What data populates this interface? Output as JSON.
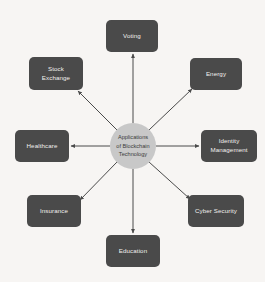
{
  "diagram": {
    "type": "radial-hub-and-spoke",
    "background_color": "#f7f5f3",
    "node_fill_color": "#4a4a4a",
    "node_text_color": "#f2f0ee",
    "hub_fill_color": "#c8c8c8",
    "hub_text_color": "#3b3b3b",
    "edge_color": "#4a4a4a",
    "arrow_direction": "outward-from-hub",
    "hub": {
      "label": "Applications\nof Blockchain\nTechnology",
      "label_flat": "Applications of Blockchain Technology",
      "shape": "circle",
      "cx": 133,
      "cy": 146,
      "r": 23
    },
    "nodes": [
      {
        "id": "voting",
        "label": "Voting",
        "position": "top",
        "x": 106,
        "y": 20,
        "width": 52,
        "height": 32
      },
      {
        "id": "energy",
        "label": "Energy",
        "position": "top-right",
        "x": 190,
        "y": 58,
        "width": 52,
        "height": 32
      },
      {
        "id": "identity-management",
        "label": "Identity\nManagement",
        "label_flat": "Identity Management",
        "position": "right",
        "x": 201,
        "y": 130,
        "width": 56,
        "height": 32
      },
      {
        "id": "cyber-security",
        "label": "Cyber Security",
        "position": "bottom-right",
        "x": 188,
        "y": 195,
        "width": 56,
        "height": 32
      },
      {
        "id": "education",
        "label": "Education",
        "position": "bottom",
        "x": 106,
        "y": 235,
        "width": 54,
        "height": 32
      },
      {
        "id": "insurance",
        "label": "Insurance",
        "position": "bottom-left",
        "x": 27,
        "y": 195,
        "width": 54,
        "height": 32
      },
      {
        "id": "healthcare",
        "label": "Healthcare",
        "position": "left",
        "x": 15,
        "y": 130,
        "width": 54,
        "height": 32
      },
      {
        "id": "stock-exchange",
        "label": "Stock\nExchange",
        "label_flat": "Stock Exchange",
        "position": "top-left",
        "x": 29,
        "y": 57,
        "width": 54,
        "height": 33
      }
    ],
    "edges": [
      {
        "from": "hub",
        "to": "voting",
        "x1": 133,
        "y1": 123,
        "x2": 133,
        "y2": 54
      },
      {
        "from": "hub",
        "to": "energy",
        "x1": 149,
        "y1": 130,
        "x2": 192,
        "y2": 89
      },
      {
        "from": "hub",
        "to": "identity-management",
        "x1": 156,
        "y1": 146,
        "x2": 199,
        "y2": 146
      },
      {
        "from": "hub",
        "to": "cyber-security",
        "x1": 149,
        "y1": 162,
        "x2": 190,
        "y2": 199
      },
      {
        "from": "hub",
        "to": "education",
        "x1": 133,
        "y1": 169,
        "x2": 133,
        "y2": 233
      },
      {
        "from": "hub",
        "to": "insurance",
        "x1": 117,
        "y1": 162,
        "x2": 80,
        "y2": 200
      },
      {
        "from": "hub",
        "to": "healthcare",
        "x1": 110,
        "y1": 146,
        "x2": 71,
        "y2": 146
      },
      {
        "from": "hub",
        "to": "stock-exchange",
        "x1": 117,
        "y1": 130,
        "x2": 78,
        "y2": 91
      }
    ]
  }
}
